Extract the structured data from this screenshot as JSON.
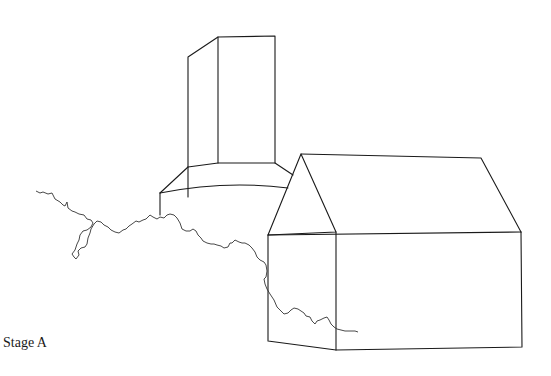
{
  "figure": {
    "label": "Stage A",
    "stroke_color": "#1a1a1a",
    "background": "#ffffff"
  }
}
